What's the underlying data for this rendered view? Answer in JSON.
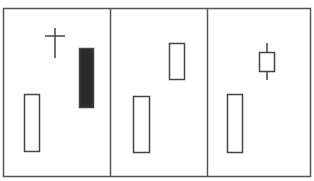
{
  "chart_data": {
    "type": "candlestick",
    "title": "",
    "xlabel": "",
    "ylabel": "",
    "grid": false,
    "legend": null,
    "colors": {
      "border": "#555555",
      "divider": "#555555",
      "candle_outline": "#444444",
      "bullish_fill": "#ffffff",
      "bearish_fill": "#2a2a2a"
    },
    "frame": {
      "x": 3,
      "y": 8,
      "width": 307,
      "height": 168
    },
    "dividers_x": [
      110,
      207
    ],
    "panels": [
      {
        "name": "panel-1",
        "candles": [
          {
            "kind": "bullish",
            "x": 24,
            "width": 16,
            "body_top": 94,
            "body_bottom": 151,
            "high": 94,
            "low": 151
          },
          {
            "kind": "doji",
            "x": 45,
            "width": 20,
            "body_top": 36,
            "body_bottom": 36,
            "high": 28,
            "low": 58
          },
          {
            "kind": "bearish",
            "x": 79,
            "width": 15,
            "body_top": 48,
            "body_bottom": 107,
            "high": 48,
            "low": 107
          }
        ]
      },
      {
        "name": "panel-2",
        "candles": [
          {
            "kind": "bullish",
            "x": 133,
            "width": 17,
            "body_top": 96,
            "body_bottom": 152,
            "high": 96,
            "low": 152
          },
          {
            "kind": "bullish",
            "x": 169,
            "width": 16,
            "body_top": 43,
            "body_bottom": 79,
            "high": 43,
            "low": 79
          }
        ]
      },
      {
        "name": "panel-3",
        "candles": [
          {
            "kind": "bullish",
            "x": 227,
            "width": 16,
            "body_top": 94,
            "body_bottom": 152,
            "high": 94,
            "low": 152
          },
          {
            "kind": "spinning-top",
            "x": 259,
            "width": 16,
            "body_top": 52,
            "body_bottom": 71,
            "high": 43,
            "low": 80
          }
        ]
      }
    ]
  }
}
